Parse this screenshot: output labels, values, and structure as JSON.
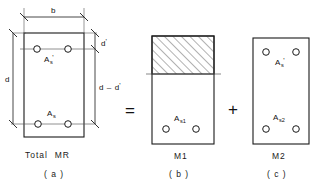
{
  "figure": {
    "equation_operators": {
      "equals": "=",
      "plus": "+"
    },
    "stroke_color": "#1a1a1a",
    "hatch_color": "#555555"
  },
  "panels": [
    {
      "id": "a",
      "caption": "( a )",
      "moment_label_plain": "Total",
      "moment_symbol": "M",
      "moment_subscript": "R",
      "bars": [
        {
          "name": "compression-steel",
          "label_main": "A",
          "label_sub": "s",
          "prime": true
        },
        {
          "name": "tension-steel",
          "label_main": "A",
          "label_sub": "s",
          "prime": false
        }
      ],
      "dimensions": [
        {
          "name": "width",
          "label_main": "b",
          "label_sub": "",
          "prime": false
        },
        {
          "name": "effective-depth",
          "label_main": "d",
          "label_sub": "",
          "prime": false
        },
        {
          "name": "cover-depth",
          "label_main": "d",
          "label_sub": "",
          "prime": true
        },
        {
          "name": "lever-arm",
          "label_main": "d – d",
          "label_sub": "",
          "prime": true
        }
      ]
    },
    {
      "id": "b",
      "caption": "( b )",
      "moment_symbol": "M",
      "moment_subscript": "1",
      "hatched_region": "compression-concrete-block",
      "bars": [
        {
          "name": "tension-steel-part1",
          "label_main": "A",
          "label_sub": "s1",
          "prime": false
        }
      ]
    },
    {
      "id": "c",
      "caption": "( c )",
      "moment_symbol": "M",
      "moment_subscript": "2",
      "bars": [
        {
          "name": "compression-steel",
          "label_main": "A",
          "label_sub": "s",
          "prime": true
        },
        {
          "name": "tension-steel-part2",
          "label_main": "A",
          "label_sub": "s2",
          "prime": false
        }
      ]
    }
  ]
}
